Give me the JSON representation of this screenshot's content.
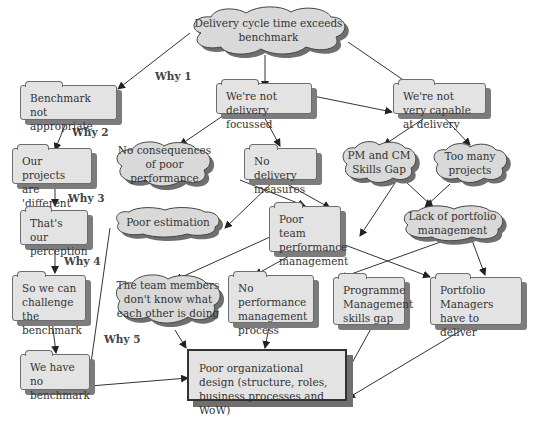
{
  "diagram": {
    "title_node": "Delivery cycle time exceeds benchmark",
    "why_labels": [
      "Why 1",
      "Why 2",
      "Why 3",
      "Why 4",
      "Why 5"
    ],
    "left_chain": [
      "Benchmark not appropriate",
      "Our projects are 'different'",
      "That's our perception",
      "So we can challenge the benchmark",
      "We have no benchmark"
    ],
    "nodes": {
      "not_delivery_focussed": "We're not delivery focussed",
      "not_capable": "We're not very capable at delivery",
      "no_consequences": "No consequences of poor performance",
      "no_delivery_measures": "No delivery measures",
      "pm_cm_skills_gap": "PM and CM Skills Gap",
      "too_many_projects": "Too many projects",
      "poor_estimation": "Poor estimation",
      "poor_team_perf": "Poor team performance management",
      "lack_portfolio": "Lack of portfolio management",
      "team_members": "The team members don't know what each other is doing",
      "no_perf_process": "No performance management process",
      "prog_mgmt_gap": "Programme Management skills gap",
      "portfolio_mgrs": "Portfolio Managers have to deliver",
      "root_cause": "Poor organizational design (structure, roles, business processes and WoW)"
    },
    "colors": {
      "fill": "#e3e3e3",
      "shadow": "#7c7c7c",
      "line": "#333333"
    }
  }
}
